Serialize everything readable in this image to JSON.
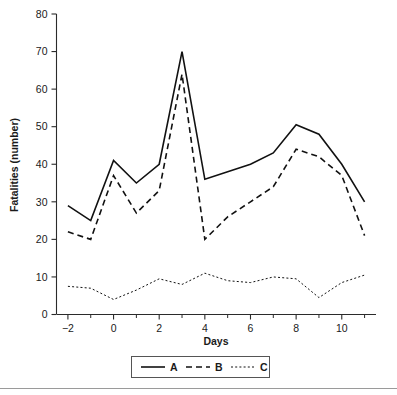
{
  "chart_data": {
    "type": "line",
    "title": "",
    "xlabel": "Days",
    "ylabel": "Fatalities (number)",
    "x": [
      -2,
      -1,
      0,
      1,
      2,
      3,
      4,
      5,
      6,
      7,
      8,
      9,
      10,
      11
    ],
    "xlim": [
      -2.5,
      11.5
    ],
    "ylim": [
      0,
      80
    ],
    "xticks": [
      -2,
      0,
      2,
      4,
      6,
      8,
      10
    ],
    "xtick_labels": [
      "−2",
      "0",
      "2",
      "4",
      "6",
      "8",
      "10"
    ],
    "xminor_ticks": [
      -1,
      1,
      3,
      5,
      7,
      9,
      11
    ],
    "yticks": [
      0,
      10,
      20,
      30,
      40,
      50,
      60,
      70,
      80
    ],
    "ytick_labels": [
      "0",
      "10",
      "20",
      "30",
      "40",
      "50",
      "60",
      "70",
      "80"
    ],
    "grid": false,
    "legend_position": "bottom",
    "series": [
      {
        "name": "A",
        "style": "solid",
        "color": "#111111",
        "values": [
          29,
          25,
          41,
          35,
          40,
          70,
          36,
          38,
          40,
          43,
          50.5,
          48,
          40,
          30
        ]
      },
      {
        "name": "B",
        "style": "dashed",
        "color": "#111111",
        "values": [
          22,
          20,
          37,
          27,
          33,
          64,
          20,
          26,
          30,
          34,
          44,
          42,
          37,
          21
        ]
      },
      {
        "name": "C",
        "style": "dotted",
        "color": "#111111",
        "values": [
          7.5,
          7,
          4,
          6.5,
          9.5,
          8,
          11,
          9,
          8.5,
          10,
          9.5,
          4.5,
          8.5,
          10.5
        ]
      }
    ]
  },
  "legend": {
    "entries": [
      {
        "label": "A",
        "style": "solid"
      },
      {
        "label": "B",
        "style": "dashed"
      },
      {
        "label": "C",
        "style": "dotted"
      }
    ]
  },
  "axes": {
    "x_title": "Days",
    "y_title": "Fatalities (number)"
  }
}
